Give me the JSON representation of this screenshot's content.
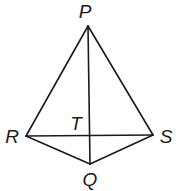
{
  "figure": {
    "title": "",
    "points": {
      "P": {
        "label": "P",
        "x": 88,
        "y": 26,
        "label_x": 85,
        "label_y": 18
      },
      "R": {
        "label": "R",
        "x": 26,
        "y": 136,
        "label_x": 12,
        "label_y": 143
      },
      "S": {
        "label": "S",
        "x": 153,
        "y": 135,
        "label_x": 165,
        "label_y": 143
      },
      "Q": {
        "label": "Q",
        "x": 90,
        "y": 164,
        "label_x": 90,
        "label_y": 186
      },
      "T": {
        "label": "T",
        "x": 90,
        "y": 136,
        "label_x": 76,
        "label_y": 130
      }
    },
    "segments": [
      {
        "name": "PR",
        "from": "P",
        "to": "R"
      },
      {
        "name": "PS",
        "from": "P",
        "to": "S"
      },
      {
        "name": "PQ",
        "from": "P",
        "to": "Q"
      },
      {
        "name": "RS",
        "from": "R",
        "to": "S"
      },
      {
        "name": "RQ",
        "from": "R",
        "to": "Q"
      },
      {
        "name": "SQ",
        "from": "S",
        "to": "Q"
      }
    ],
    "colors": {
      "stroke": "#1a1a1a",
      "background": "#ffffff"
    }
  }
}
